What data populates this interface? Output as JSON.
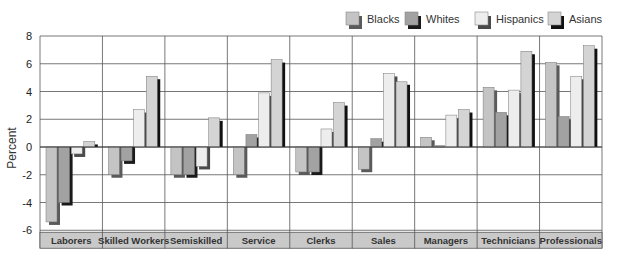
{
  "chart_data": {
    "type": "bar",
    "title": "",
    "xlabel": "",
    "ylabel": "Percent",
    "ylim": [
      -6,
      8
    ],
    "yticks": [
      8,
      6,
      4,
      2,
      0,
      -2,
      -4,
      -6
    ],
    "grid": true,
    "legend_position": "top-right",
    "categories": [
      "Laborers",
      "Skilled Workers",
      "Semiskilled",
      "Service",
      "Clerks",
      "Sales",
      "Managers",
      "Technicians",
      "Professionals"
    ],
    "series": [
      {
        "name": "Blacks",
        "color": "#c4c4c4",
        "shadow": "#5a5a5a",
        "values": [
          -5.4,
          -2.0,
          -2.0,
          -2.0,
          -1.8,
          -1.6,
          0.7,
          4.3,
          6.1
        ]
      },
      {
        "name": "Whites",
        "color": "#a2a2a2",
        "shadow": "#1a1a1a",
        "values": [
          -4.0,
          -1.0,
          -2.0,
          0.9,
          -1.8,
          0.6,
          0.1,
          2.5,
          2.2
        ]
      },
      {
        "name": "Hispanics",
        "color": "#ededed",
        "shadow": "#4a4a4a",
        "values": [
          -0.5,
          2.7,
          -1.4,
          3.9,
          1.3,
          5.3,
          2.3,
          4.1,
          5.1
        ]
      },
      {
        "name": "Asians",
        "color": "#d4d4d4",
        "shadow": "#111111",
        "values": [
          0.4,
          5.1,
          2.1,
          6.3,
          3.2,
          4.7,
          2.7,
          6.9,
          7.3
        ]
      }
    ]
  },
  "colors": {
    "gridline": "#555555",
    "category_band": "#c9c9c9",
    "bar_outline": "#777777"
  }
}
